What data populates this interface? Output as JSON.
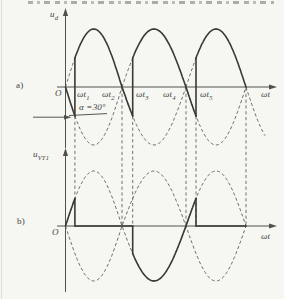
{
  "figure_labels": {
    "panel_a": {
      "panel": "a)",
      "y_label_base": "u",
      "y_label_sub": "d",
      "origin": "O",
      "x_axis_label": "ωt",
      "ticks": [
        {
          "b": "ωt",
          "s": "1"
        },
        {
          "b": "ωt",
          "s": "2"
        },
        {
          "b": "ωt",
          "s": "3"
        },
        {
          "b": "ωt",
          "s": "4"
        },
        {
          "b": "ωt",
          "s": "5"
        }
      ],
      "alpha_annotation": "α =30°"
    },
    "panel_b": {
      "panel": "b)",
      "y_label_base": "u",
      "y_label_sub": "VT1",
      "origin": "O",
      "x_axis_label": "ωt"
    }
  },
  "chart_data": {
    "type": "line",
    "xlabel": "ωt",
    "alpha_deg": 30,
    "firing_instants_deg": [
      30,
      210,
      390
    ],
    "zero_crossings_deg": [
      0,
      180,
      360,
      540
    ],
    "panels": [
      {
        "id": "a",
        "ylabel": "ud",
        "axis_y": 87,
        "amplitude": 58,
        "x_map": [
          [
            0,
            65.5
          ],
          [
            180,
            122
          ],
          [
            360,
            186
          ],
          [
            540,
            246
          ]
        ],
        "y_axis": {
          "x": 65.5,
          "y1": 12,
          "y2": 148
        },
        "x_axis": {
          "y": 87,
          "x1": 57,
          "x2": 272
        },
        "solid": [
          {
            "type": "curve",
            "fn": "-sin",
            "range": [
              0,
              30
            ]
          },
          {
            "type": "vline",
            "deg": 30,
            "v1": -0.5,
            "v2": 0.5
          },
          {
            "type": "curve",
            "fn": "sin",
            "range": [
              30,
              210
            ]
          },
          {
            "type": "vline",
            "deg": 210,
            "v1": -0.5,
            "v2": 0.5
          },
          {
            "type": "curve",
            "fn": "sin-180",
            "range": [
              210,
              390
            ]
          },
          {
            "type": "vline",
            "deg": 390,
            "v1": -0.5,
            "v2": 0.5
          },
          {
            "type": "curve",
            "fn": "sin-360",
            "range": [
              390,
              540
            ]
          }
        ],
        "dashed": [
          {
            "fn": "sin",
            "range": [
              0,
              30
            ]
          },
          {
            "fn": "-sin",
            "range": [
              30,
              180
            ]
          },
          {
            "fn": "sin",
            "range": [
              180,
              360
            ]
          },
          {
            "fn": "sin-180",
            "range": [
              180,
              210
            ]
          },
          {
            "fn": "sin-180",
            "range": [
              360,
              540
            ]
          },
          {
            "fn": "sin-360",
            "range": [
              360,
              390
            ]
          },
          {
            "fn": "sin",
            "range": [
              540,
              597
            ]
          }
        ],
        "guides": [
          {
            "deg": 30,
            "y1": 116,
            "y2": 198.5
          },
          {
            "deg": 180,
            "y1": 88,
            "y2": 226
          },
          {
            "deg": 210,
            "y1": 116,
            "y2": 226
          },
          {
            "deg": 360,
            "y1": 88,
            "y2": 226
          },
          {
            "deg": 390,
            "y1": 116,
            "y2": 226
          },
          {
            "deg": 540,
            "y1": 88,
            "y2": 226
          }
        ]
      },
      {
        "id": "b",
        "ylabel": "uVT1",
        "axis_y": 226,
        "amplitude": 55,
        "x_map": [
          [
            0,
            65.5
          ],
          [
            180,
            122
          ],
          [
            360,
            186
          ],
          [
            540,
            246
          ]
        ],
        "y_axis": {
          "x": 65.5,
          "y1": 152,
          "y2": 292
        },
        "x_axis": {
          "y": 226,
          "x1": 57,
          "x2": 272
        },
        "solid": [
          {
            "type": "curve",
            "fn": "sin",
            "range": [
              0,
              30
            ]
          },
          {
            "type": "vline",
            "deg": 30,
            "v1": 0.5,
            "v2": 0
          },
          {
            "type": "baseline",
            "range": [
              30,
              210
            ]
          },
          {
            "type": "vline",
            "deg": 210,
            "v1": 0,
            "v2": -0.5
          },
          {
            "type": "curve",
            "fn": "sin",
            "range": [
              210,
              390
            ]
          },
          {
            "type": "vline",
            "deg": 390,
            "v1": 0.5,
            "v2": 0
          },
          {
            "type": "baseline",
            "range": [
              390,
              540
            ]
          }
        ],
        "dashed": [
          {
            "fn": "sin",
            "range": [
              0,
              540
            ]
          },
          {
            "fn": "-sin",
            "range": [
              0,
              540
            ]
          }
        ],
        "guides": []
      }
    ]
  }
}
